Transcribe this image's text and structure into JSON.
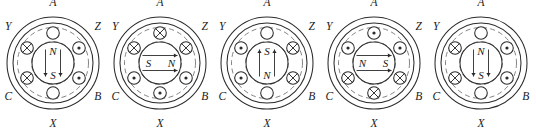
{
  "figure": {
    "type": "diagram",
    "panel_count": 5,
    "terminal_labels": [
      "A",
      "Z",
      "B",
      "X",
      "C",
      "Y"
    ],
    "slot_symbols": {
      "cross": "current into page",
      "dot": "current out of page",
      "empty": "no current"
    }
  },
  "panels": [
    {
      "id": "panel-1",
      "index": 1,
      "labels": {
        "A": "A",
        "Z": "Z",
        "B": "B",
        "X": "X",
        "C": "C",
        "Y": "Y"
      },
      "pole_top": "N",
      "pole_bottom": "S",
      "pole_left": "",
      "pole_right": "",
      "field_direction": "down",
      "slots": [
        {
          "position": "top",
          "angle": -90,
          "mark": "empty"
        },
        {
          "position": "upper-right",
          "angle": -30,
          "mark": "dot"
        },
        {
          "position": "lower-right",
          "angle": 30,
          "mark": "dot"
        },
        {
          "position": "bottom",
          "angle": 90,
          "mark": "empty"
        },
        {
          "position": "lower-left",
          "angle": 150,
          "mark": "cross"
        },
        {
          "position": "upper-left",
          "angle": -150,
          "mark": "cross"
        }
      ]
    },
    {
      "id": "panel-2",
      "index": 2,
      "labels": {
        "A": "A",
        "Z": "Z",
        "B": "B",
        "X": "X",
        "C": "C",
        "Y": "Y"
      },
      "pole_top": "",
      "pole_bottom": "",
      "pole_left": "S",
      "pole_right": "N",
      "field_direction": "right",
      "slots": [
        {
          "position": "top",
          "angle": -90,
          "mark": "cross"
        },
        {
          "position": "upper-right",
          "angle": -30,
          "mark": "cross"
        },
        {
          "position": "lower-right",
          "angle": 30,
          "mark": "dot"
        },
        {
          "position": "bottom",
          "angle": 90,
          "mark": "dot"
        },
        {
          "position": "lower-left",
          "angle": 150,
          "mark": "dot"
        },
        {
          "position": "upper-left",
          "angle": -150,
          "mark": "cross"
        }
      ]
    },
    {
      "id": "panel-3",
      "index": 3,
      "labels": {
        "A": "A",
        "Z": "Z",
        "B": "B",
        "X": "X",
        "C": "C",
        "Y": "Y"
      },
      "pole_top": "S",
      "pole_bottom": "N",
      "pole_left": "",
      "pole_right": "",
      "field_direction": "up",
      "slots": [
        {
          "position": "top",
          "angle": -90,
          "mark": "empty"
        },
        {
          "position": "upper-right",
          "angle": -30,
          "mark": "cross"
        },
        {
          "position": "lower-right",
          "angle": 30,
          "mark": "cross"
        },
        {
          "position": "bottom",
          "angle": 90,
          "mark": "empty"
        },
        {
          "position": "lower-left",
          "angle": 150,
          "mark": "dot"
        },
        {
          "position": "upper-left",
          "angle": -150,
          "mark": "dot"
        }
      ]
    },
    {
      "id": "panel-4",
      "index": 4,
      "labels": {
        "A": "A",
        "Z": "Z",
        "B": "B",
        "X": "X",
        "C": "C",
        "Y": "Y"
      },
      "pole_top": "",
      "pole_bottom": "",
      "pole_left": "N",
      "pole_right": "S",
      "field_direction": "right",
      "slots": [
        {
          "position": "top",
          "angle": -90,
          "mark": "dot"
        },
        {
          "position": "upper-right",
          "angle": -30,
          "mark": "dot"
        },
        {
          "position": "lower-right",
          "angle": 30,
          "mark": "cross"
        },
        {
          "position": "bottom",
          "angle": 90,
          "mark": "cross"
        },
        {
          "position": "lower-left",
          "angle": 150,
          "mark": "cross"
        },
        {
          "position": "upper-left",
          "angle": -150,
          "mark": "dot"
        }
      ]
    },
    {
      "id": "panel-5",
      "index": 5,
      "labels": {
        "A": "A",
        "Z": "",
        "B": "B",
        "X": "X",
        "C": "C",
        "Y": "Y"
      },
      "pole_top": "N",
      "pole_bottom": "S",
      "pole_left": "",
      "pole_right": "",
      "field_direction": "down",
      "slots": [
        {
          "position": "top",
          "angle": -90,
          "mark": "empty"
        },
        {
          "position": "upper-right",
          "angle": -30,
          "mark": "dot"
        },
        {
          "position": "lower-right",
          "angle": 30,
          "mark": "dot"
        },
        {
          "position": "bottom",
          "angle": 90,
          "mark": "empty"
        },
        {
          "position": "lower-left",
          "angle": 150,
          "mark": "cross"
        },
        {
          "position": "upper-left",
          "angle": -150,
          "mark": "cross"
        }
      ]
    }
  ],
  "geometry": {
    "panel_width": 107,
    "panel_height": 136,
    "center_x": 53,
    "center_y": 63,
    "r_outer": 46,
    "r_inner": 40,
    "r_dashed": 35.5,
    "r_slot_ring": 30,
    "r_rotor": 21,
    "r_slot": 6.3
  },
  "colors": {
    "stroke": "#2b2b2b",
    "dashed": "#6e6e6e",
    "background": "#ffffff",
    "text": "#1a1a1a"
  }
}
